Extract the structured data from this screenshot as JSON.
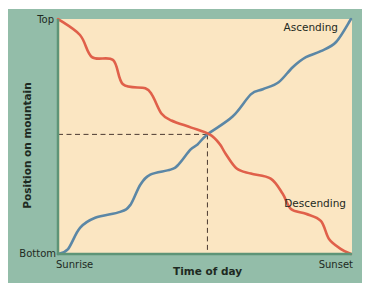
{
  "chart_data": {
    "type": "line",
    "title": "",
    "xlabel": "Time of day",
    "ylabel": "Position on mountain",
    "x_ticks": [
      "Sunrise",
      "Sunset"
    ],
    "y_ticks": [
      "Bottom",
      "Top"
    ],
    "xlim": [
      0,
      1
    ],
    "ylim": [
      0,
      1
    ],
    "grid": false,
    "series": [
      {
        "name": "Ascending",
        "color": "#5b87a6",
        "points": [
          [
            0.0,
            0.0
          ],
          [
            0.034,
            0.021
          ],
          [
            0.075,
            0.111
          ],
          [
            0.127,
            0.154
          ],
          [
            0.212,
            0.179
          ],
          [
            0.247,
            0.209
          ],
          [
            0.281,
            0.295
          ],
          [
            0.315,
            0.338
          ],
          [
            0.384,
            0.359
          ],
          [
            0.411,
            0.38
          ],
          [
            0.452,
            0.444
          ],
          [
            0.476,
            0.466
          ],
          [
            0.51,
            0.509
          ],
          [
            0.596,
            0.585
          ],
          [
            0.658,
            0.679
          ],
          [
            0.699,
            0.701
          ],
          [
            0.753,
            0.731
          ],
          [
            0.801,
            0.795
          ],
          [
            0.846,
            0.838
          ],
          [
            0.897,
            0.863
          ],
          [
            0.949,
            0.902
          ],
          [
            1.0,
            1.0
          ]
        ],
        "label_position": "top-right"
      },
      {
        "name": "Descending",
        "color": "#e0604a",
        "points": [
          [
            0.0,
            1.0
          ],
          [
            0.075,
            0.932
          ],
          [
            0.116,
            0.838
          ],
          [
            0.188,
            0.825
          ],
          [
            0.222,
            0.722
          ],
          [
            0.298,
            0.705
          ],
          [
            0.322,
            0.675
          ],
          [
            0.353,
            0.598
          ],
          [
            0.387,
            0.568
          ],
          [
            0.455,
            0.538
          ],
          [
            0.517,
            0.509
          ],
          [
            0.551,
            0.47
          ],
          [
            0.572,
            0.427
          ],
          [
            0.61,
            0.364
          ],
          [
            0.658,
            0.342
          ],
          [
            0.726,
            0.321
          ],
          [
            0.767,
            0.256
          ],
          [
            0.795,
            0.192
          ],
          [
            0.846,
            0.171
          ],
          [
            0.897,
            0.141
          ],
          [
            0.925,
            0.064
          ],
          [
            0.966,
            0.021
          ],
          [
            1.0,
            0.0
          ]
        ],
        "label_position": "lower-right"
      }
    ],
    "annotations": [
      {
        "type": "intersection-guides",
        "style": "dashed",
        "x": 0.51,
        "y": 0.509,
        "description": "Dashed lines from the y-axis and x-axis meeting where the two paths cross"
      }
    ]
  }
}
